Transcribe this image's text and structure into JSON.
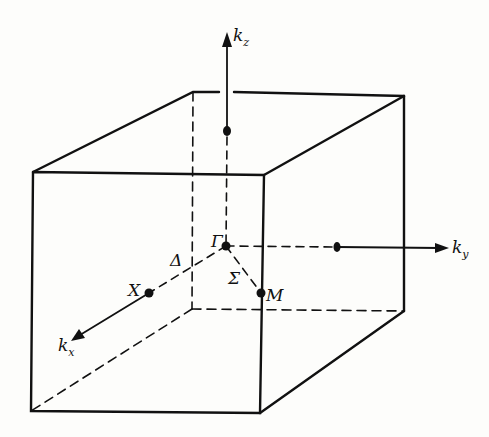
{
  "figure": {
    "labels": {
      "kz": {
        "base": "k",
        "sub": "z"
      },
      "ky": {
        "base": "k",
        "sub": "y"
      },
      "kx": {
        "base": "k",
        "sub": "x"
      },
      "gamma": "Γ",
      "delta": "Δ",
      "sigma": "Σ",
      "x_point": "X",
      "m_point": "M"
    },
    "colors": {
      "line": "#111111",
      "background": "#fdfdfb"
    }
  }
}
